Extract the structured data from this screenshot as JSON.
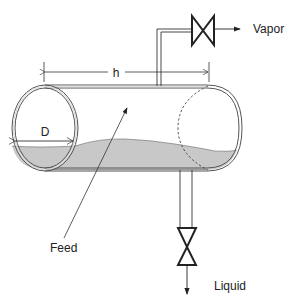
{
  "diagram": {
    "type": "horizontal flash drum",
    "labels": {
      "vapor": "Vapor",
      "liquid": "Liquid",
      "feed": "Feed",
      "length": "h",
      "diameter": "D"
    },
    "colors": {
      "line": "#333333",
      "shell_inner": "#e8e8e8",
      "liquid_fill": "#c8c8c8",
      "background": "#ffffff"
    },
    "components": [
      {
        "id": "drum",
        "name": "Horizontal drum vessel"
      },
      {
        "id": "vapor-valve",
        "name": "Vapor outlet valve",
        "outlet": "Vapor"
      },
      {
        "id": "liquid-valve",
        "name": "Liquid outlet valve",
        "outlet": "Liquid"
      },
      {
        "id": "feed-inlet",
        "name": "Feed inlet"
      }
    ]
  }
}
